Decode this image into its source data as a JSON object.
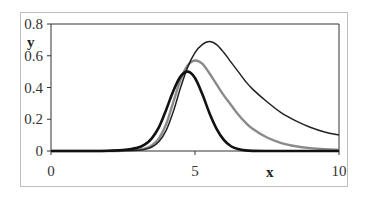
{
  "chart_data": {
    "type": "line",
    "title": "",
    "xlabel": "x",
    "ylabel": "y",
    "xlim": [
      0,
      10
    ],
    "ylim": [
      0,
      0.8
    ],
    "x_ticks": [
      "0",
      "5",
      "10"
    ],
    "y_ticks": [
      "0",
      "0.2",
      "0.4",
      "0.6",
      "0.8"
    ],
    "grid": false,
    "legend": "none",
    "x": [
      0,
      0.5,
      1,
      1.5,
      2,
      2.5,
      3,
      3.25,
      3.5,
      3.75,
      4,
      4.25,
      4.5,
      4.75,
      5,
      5.25,
      5.5,
      5.75,
      6,
      6.25,
      6.5,
      6.75,
      7,
      7.5,
      8,
      8.5,
      9,
      9.5,
      10
    ],
    "series": [
      {
        "name": "thick black",
        "color": "#111111",
        "width": 2.6,
        "values": [
          0,
          0,
          0,
          0,
          0.002,
          0.006,
          0.02,
          0.04,
          0.08,
          0.15,
          0.26,
          0.38,
          0.47,
          0.5,
          0.46,
          0.36,
          0.24,
          0.14,
          0.07,
          0.03,
          0.012,
          0.004,
          0.001,
          0,
          0,
          0,
          0,
          0,
          0
        ]
      },
      {
        "name": "gray",
        "color": "#8a8a8a",
        "width": 2.4,
        "values": [
          0,
          0,
          0,
          0,
          0,
          0.002,
          0.006,
          0.015,
          0.035,
          0.08,
          0.17,
          0.31,
          0.45,
          0.54,
          0.57,
          0.55,
          0.49,
          0.42,
          0.35,
          0.29,
          0.23,
          0.18,
          0.14,
          0.085,
          0.05,
          0.03,
          0.018,
          0.011,
          0.007
        ]
      },
      {
        "name": "thin black",
        "color": "#222222",
        "width": 1.5,
        "values": [
          0,
          0,
          0,
          0,
          0,
          0.001,
          0.004,
          0.01,
          0.025,
          0.06,
          0.13,
          0.25,
          0.4,
          0.53,
          0.62,
          0.67,
          0.69,
          0.67,
          0.62,
          0.56,
          0.5,
          0.44,
          0.39,
          0.31,
          0.24,
          0.19,
          0.15,
          0.12,
          0.1
        ]
      }
    ]
  }
}
